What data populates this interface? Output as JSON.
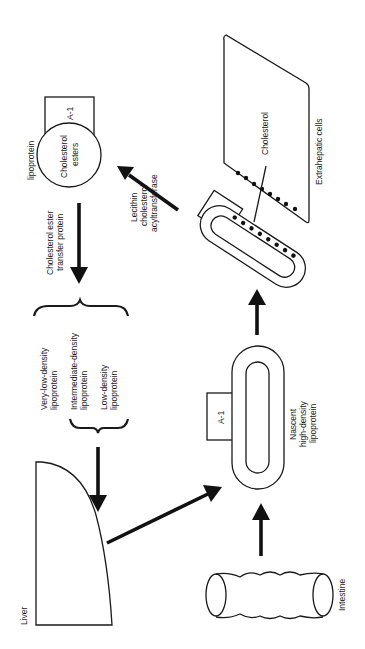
{
  "diagram": {
    "orientation": "rotated 90° counter-clockwise",
    "nodes": {
      "liver": {
        "label": "Liver"
      },
      "intestine": {
        "label": "Intestine"
      },
      "nascent_hdl": {
        "label_line1": "Nascent",
        "label_line2": "high-density",
        "label_line3": "lipoprotein",
        "apo_label": "A-1"
      },
      "mature_hdl": {
        "apo_label": "A-1"
      },
      "extrahepatic_cells": {
        "label": "Extrahepatic cells",
        "cholesterol_label": "Cholesterol"
      },
      "lcat": {
        "label_line1": "Lecithin",
        "label_line2": "cholesterol",
        "label_line3": "acyltransferase"
      },
      "lipoprotein_particle": {
        "label": "lipoprotein",
        "core_line1": "Cholesterol",
        "core_line2": "esters",
        "apo_label": "A-1"
      },
      "cetp": {
        "label_line1": "Cholesterol ester",
        "label_line2": "transfer protein"
      },
      "lipoprotein_group": {
        "vldl_line1": "Very-low-density",
        "vldl_line2": "lipoprotein",
        "idl_line1": "Intermediate-density",
        "idl_line2": "lipoprotein",
        "ldl_line1": "Low-density",
        "ldl_line2": "lipoprotein"
      }
    },
    "edges": [
      {
        "from": "intestine",
        "to": "nascent_hdl"
      },
      {
        "from": "liver",
        "to": "nascent_hdl"
      },
      {
        "from": "nascent_hdl",
        "to": "mature_hdl"
      },
      {
        "from": "mature_hdl",
        "to": "lipoprotein_particle",
        "label": "Lecithin cholesterol acyltransferase"
      },
      {
        "from": "lipoprotein_particle",
        "to": "lipoprotein_group",
        "label": "Cholesterol ester transfer protein"
      },
      {
        "from": "lipoprotein_group",
        "to": "liver"
      }
    ],
    "colors": {
      "ink": "#1a1a1a",
      "background": "#ffffff"
    }
  }
}
